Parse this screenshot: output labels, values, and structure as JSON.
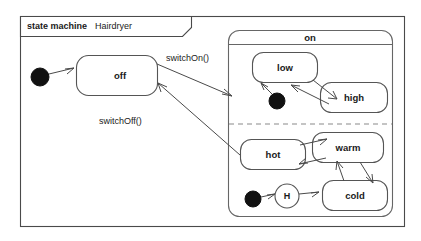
{
  "diagram": {
    "kind_label": "state machine",
    "name": "Hairdryer",
    "frame": {
      "x": 20,
      "y": 16,
      "width": 385,
      "height": 211
    },
    "tab": {
      "x": 20,
      "y": 16,
      "width": 171,
      "height": 20,
      "clip": 9
    }
  },
  "states": {
    "off": {
      "label": "off",
      "x": 76,
      "y": 55,
      "width": 82,
      "height": 41,
      "rx": 12,
      "label_x": 120,
      "label_y": 75
    },
    "on": {
      "label": "on",
      "x": 228,
      "y": 30,
      "width": 165,
      "height": 187,
      "rx": 11,
      "title_y": 44,
      "label_x": 310,
      "label_y": 37
    },
    "low": {
      "label": "low",
      "x": 252,
      "y": 52,
      "width": 66,
      "height": 31,
      "rx": 11,
      "label_x": 285,
      "label_y": 67
    },
    "high": {
      "label": "high",
      "x": 320,
      "y": 82,
      "width": 68,
      "height": 31,
      "rx": 11,
      "label_x": 354,
      "label_y": 97
    },
    "hot": {
      "label": "hot",
      "x": 240,
      "y": 139,
      "width": 66,
      "height": 31,
      "rx": 11,
      "label_x": 273,
      "label_y": 155
    },
    "warm": {
      "label": "warm",
      "x": 312,
      "y": 132,
      "width": 72,
      "height": 31,
      "rx": 11,
      "label_x": 348,
      "label_y": 147
    },
    "cold": {
      "label": "cold",
      "x": 322,
      "y": 180,
      "width": 66,
      "height": 31,
      "rx": 11,
      "label_x": 355,
      "label_y": 196
    }
  },
  "pseudostates": {
    "initial_off": {
      "cx": 40,
      "cy": 77,
      "r": 9
    },
    "initial_low": {
      "cx": 277,
      "cy": 101,
      "r": 8
    },
    "initial_history": {
      "cx": 253,
      "cy": 199,
      "r": 8
    },
    "history": {
      "label": "H",
      "cx": 287,
      "cy": 196,
      "r": 12
    }
  },
  "region_divider": {
    "x1": 229,
    "y1": 124,
    "x2": 392,
    "y2": 124
  },
  "transitions": [
    {
      "name": "initial-to-off",
      "label": ""
    },
    {
      "name": "off-to-on",
      "label": "switchOn()",
      "label_x": 166,
      "label_y": 59
    },
    {
      "name": "on-to-off",
      "label": "switchOff()",
      "label_x": 99,
      "label_y": 122
    },
    {
      "name": "low-to-high",
      "label": ""
    },
    {
      "name": "high-to-low",
      "label": ""
    },
    {
      "name": "initial-to-low",
      "label": ""
    },
    {
      "name": "hot-to-warm",
      "label": ""
    },
    {
      "name": "warm-to-hot",
      "label": ""
    },
    {
      "name": "warm-to-cold",
      "label": ""
    },
    {
      "name": "cold-to-warm",
      "label": ""
    },
    {
      "name": "initial-to-history",
      "label": ""
    },
    {
      "name": "history-to-cold",
      "label": ""
    }
  ]
}
